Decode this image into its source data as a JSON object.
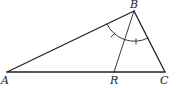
{
  "diagram": {
    "points": {
      "A": {
        "label": "A",
        "x": 7,
        "y": 72
      },
      "B": {
        "label": "B",
        "x": 134,
        "y": 11
      },
      "C": {
        "label": "C",
        "x": 165,
        "y": 72
      },
      "R": {
        "label": "R",
        "x": 114,
        "y": 72
      }
    },
    "segments": [
      "AB",
      "BC",
      "AC",
      "BR"
    ],
    "angle_marks": {
      "vertex": "B",
      "description": "Arc at B with single tick marks on each half, indicating angle ABR equals angle RBC"
    },
    "colors": {
      "stroke": "#222222",
      "label": "#222222",
      "background": "#ffffff"
    }
  }
}
